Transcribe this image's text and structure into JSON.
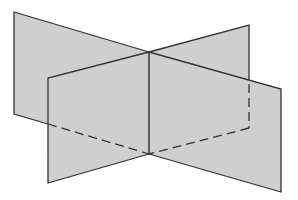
{
  "diagram": {
    "title": "",
    "colors": {
      "background": "#ffffff",
      "plane_fill": "#cfcfcf",
      "edge": "#333333"
    },
    "planes": [
      {
        "name": "plane-a",
        "corners": [
          [
            14,
            12
          ],
          [
            149,
            52
          ],
          [
            149,
            154
          ],
          [
            14,
            114
          ]
        ],
        "hidden_corners": [
          [
            149,
            52
          ],
          [
            249,
            25
          ],
          [
            249,
            128
          ],
          [
            149,
            154
          ]
        ]
      },
      {
        "name": "plane-b",
        "corners": [
          [
            48,
            78
          ],
          [
            149,
            52
          ],
          [
            149,
            154
          ],
          [
            48,
            183
          ]
        ]
      }
    ],
    "intersection_line": [
      [
        149,
        52
      ],
      [
        149,
        154
      ]
    ]
  }
}
